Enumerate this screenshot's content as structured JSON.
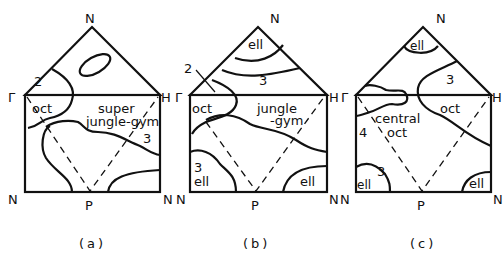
{
  "figure": {
    "panels": [
      {
        "id": "a",
        "caption": "(a)",
        "vertices": {
          "top": "N",
          "left": "Γ",
          "right": "H",
          "bottom_left": "N",
          "bottom_right": "N",
          "bottom_mid": "P"
        },
        "regions": [
          "2",
          "oct",
          "super",
          "jungle-gym",
          "3"
        ]
      },
      {
        "id": "b",
        "caption": "(b)",
        "vertices": {
          "top": "N",
          "left": "Γ",
          "right": "H",
          "bottom_left": "N",
          "bottom_right": "N",
          "bottom_mid": "P",
          "left_outer": "H"
        },
        "regions": [
          "ell",
          "2",
          "3",
          "oct",
          "jungle",
          "-gym",
          "3",
          "ell",
          "ell"
        ]
      },
      {
        "id": "c",
        "caption": "(c)",
        "vertices": {
          "top": "N",
          "left": "Γ",
          "right": "H",
          "bottom_left": "N",
          "bottom_right": "N",
          "bottom_mid": "P",
          "left_outer": "H"
        },
        "regions": [
          "ell",
          "3",
          "oct",
          "4",
          "central",
          "oct",
          "3",
          "ell",
          "ell"
        ]
      }
    ]
  }
}
